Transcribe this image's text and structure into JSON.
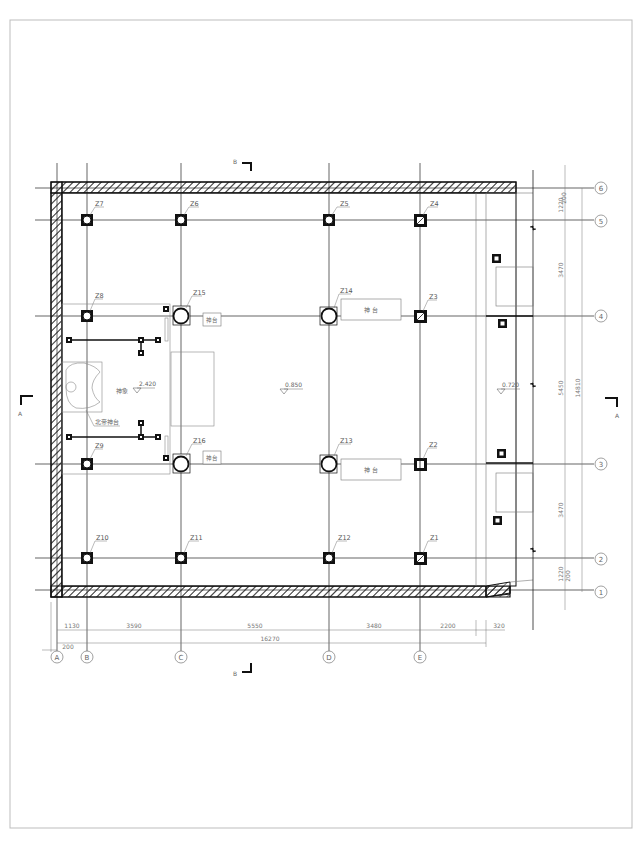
{
  "drawing": {
    "type": "structural floor plan",
    "frame_color": "#bdbdbd",
    "line_color": "#111111",
    "text_color": "#666666"
  },
  "section_markers": {
    "top": "B",
    "bottom": "B",
    "left": "A",
    "right": "A"
  },
  "grid": {
    "columns": [
      {
        "id": "A",
        "label": "A"
      },
      {
        "id": "B",
        "label": "B"
      },
      {
        "id": "C",
        "label": "C"
      },
      {
        "id": "D",
        "label": "D"
      },
      {
        "id": "E",
        "label": "E"
      }
    ],
    "rows": [
      {
        "id": "6",
        "label": "6"
      },
      {
        "id": "5",
        "label": "5"
      },
      {
        "id": "4",
        "label": "4"
      },
      {
        "id": "3",
        "label": "3"
      },
      {
        "id": "2",
        "label": "2"
      },
      {
        "id": "1",
        "label": "1"
      }
    ]
  },
  "columns": [
    {
      "id": "Z1",
      "label": "Z1"
    },
    {
      "id": "Z2",
      "label": "Z2"
    },
    {
      "id": "Z3",
      "label": "Z3"
    },
    {
      "id": "Z4",
      "label": "Z4"
    },
    {
      "id": "Z5",
      "label": "Z5"
    },
    {
      "id": "Z6",
      "label": "Z6"
    },
    {
      "id": "Z7",
      "label": "Z7"
    },
    {
      "id": "Z8",
      "label": "Z8"
    },
    {
      "id": "Z9",
      "label": "Z9"
    },
    {
      "id": "Z10",
      "label": "Z10"
    },
    {
      "id": "Z11",
      "label": "Z11"
    },
    {
      "id": "Z12",
      "label": "Z12"
    },
    {
      "id": "Z13",
      "label": "Z13"
    },
    {
      "id": "Z14",
      "label": "Z14"
    },
    {
      "id": "Z15",
      "label": "Z15"
    },
    {
      "id": "Z16",
      "label": "Z16"
    }
  ],
  "rooms": {
    "altar_upper": "神  台",
    "altar_lower": "神  台",
    "altar_small_upper": "神台",
    "altar_small_lower": "神台",
    "statue": "神象",
    "north_altar": "北帝神台"
  },
  "elevations": {
    "statue": "2.420",
    "main_hall": "0.850",
    "porch": "0.720"
  },
  "dimensions": {
    "horizontal": {
      "a_offset": "200",
      "ab": "1130",
      "bc": "3590",
      "cd": "5550",
      "de": "3480",
      "e_porch": "2200",
      "porch_edge": "320",
      "total": "16270"
    },
    "vertical": {
      "top_offset": "200",
      "r6_r5": "1220",
      "r5_r4": "3470",
      "r4_r3": "5450",
      "r3_r2": "3470",
      "r2_r1": "1220",
      "bottom_offset": "200",
      "total": "14810"
    }
  }
}
